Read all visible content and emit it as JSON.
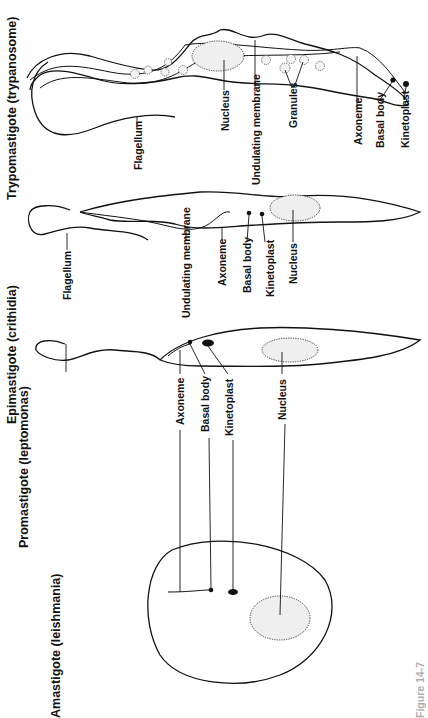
{
  "figure": {
    "orientation": "rotated 90deg counter-clockwise",
    "caption_partial": "Figure 14-7"
  },
  "forms": [
    {
      "id": "trypomastigote",
      "title": "Trypomastigote (trypanosome)",
      "labels": {
        "flagellum": "Flagellum",
        "nucleus": "Nucleus",
        "undulating_membrane": "Undulating membrane",
        "granules": "Granules",
        "axoneme": "Axoneme",
        "basal_body": "Basal body",
        "kinetoplast": "Kinetoplast"
      }
    },
    {
      "id": "epimastigote",
      "title": "Epimastigote (crithidia)",
      "labels": {
        "flagellum": "Flagellum",
        "undulating_membrane": "Undulating membrane",
        "axoneme": "Axoneme",
        "basal_body": "Basal body",
        "kinetoplast": "Kinetoplast",
        "nucleus": "Nucleus"
      }
    },
    {
      "id": "promastigote",
      "title": "Promastigote (leptomonas)",
      "labels": {
        "axoneme": "Axoneme",
        "basal_body": "Basal body",
        "kinetoplast": "Kinetoplast",
        "nucleus": "Nucleus"
      }
    },
    {
      "id": "amastigote",
      "title": "Amastigote (leishmania)",
      "labels": {}
    }
  ]
}
